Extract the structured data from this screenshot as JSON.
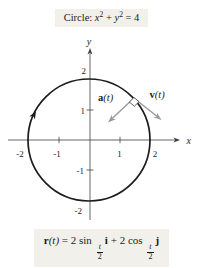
{
  "title": {
    "label_word": "Circle: ",
    "x_var": "x",
    "x_exp": "2",
    "plus": " + ",
    "y_var": "y",
    "y_exp": "2",
    "rhs": " = 4"
  },
  "graph": {
    "y_axis_label": "y",
    "x_axis_label": "x",
    "x_tick_labels": [
      "-2",
      "-1",
      "1",
      "2"
    ],
    "y_tick_labels": [
      "2",
      "1",
      "-1",
      "-2"
    ],
    "accel_vector": {
      "name": "a",
      "arg": "(t)"
    },
    "vel_vector": {
      "name": "v",
      "arg": "(t)"
    }
  },
  "formula": {
    "r": "r",
    "arg": "(t)",
    "eq": " = 2 sin ",
    "frac1_num": "t",
    "frac1_den": "2",
    "i": "i",
    "plus": " + 2 cos ",
    "frac2_num": "t",
    "frac2_den": "2",
    "j": "j"
  },
  "colors": {
    "circle": "#1c1c1c",
    "axis": "#3f3f3f",
    "vector": "#9b9b9b",
    "box_bg": "#f2f0ea",
    "text": "#1c1c1c"
  }
}
